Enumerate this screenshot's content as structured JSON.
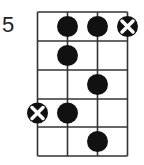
{
  "diagram": {
    "type": "bass-scale-fretboard",
    "start_fret_label": "5",
    "strings": 4,
    "frets": 5,
    "colors": {
      "line": "#333333",
      "dot": "#111111",
      "mute_bg": "#111111",
      "mute_x": "#ffffff"
    },
    "markers": [
      {
        "fret": 1,
        "string": 2,
        "kind": "dot"
      },
      {
        "fret": 1,
        "string": 3,
        "kind": "dot"
      },
      {
        "fret": 1,
        "string": 4,
        "kind": "x"
      },
      {
        "fret": 2,
        "string": 2,
        "kind": "dot"
      },
      {
        "fret": 3,
        "string": 3,
        "kind": "dot"
      },
      {
        "fret": 4,
        "string": 1,
        "kind": "x"
      },
      {
        "fret": 4,
        "string": 2,
        "kind": "dot"
      },
      {
        "fret": 5,
        "string": 3,
        "kind": "dot"
      }
    ]
  }
}
